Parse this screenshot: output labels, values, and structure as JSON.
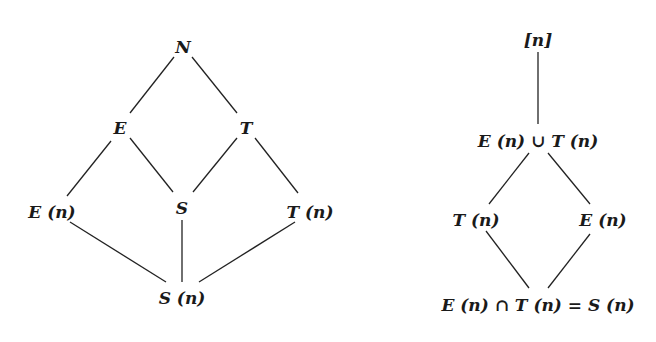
{
  "left_lattice": {
    "nodes": {
      "N": {
        "label": "N",
        "x": 183,
        "y": 47
      },
      "E": {
        "label": "E",
        "x": 120,
        "y": 128
      },
      "T": {
        "label": "T",
        "x": 246,
        "y": 128
      },
      "En": {
        "label": "E (n)",
        "x": 52,
        "y": 212
      },
      "S": {
        "label": "S",
        "x": 182,
        "y": 208
      },
      "Tn": {
        "label": "T (n)",
        "x": 310,
        "y": 212
      },
      "Sn": {
        "label": "S (n)",
        "x": 182,
        "y": 298
      }
    },
    "edges": [
      [
        "N",
        "E"
      ],
      [
        "N",
        "T"
      ],
      [
        "E",
        "En"
      ],
      [
        "E",
        "S"
      ],
      [
        "T",
        "S"
      ],
      [
        "T",
        "Tn"
      ],
      [
        "En",
        "Sn"
      ],
      [
        "S",
        "Sn"
      ],
      [
        "Tn",
        "Sn"
      ]
    ]
  },
  "right_lattice": {
    "nodes": {
      "top": {
        "label": "[n]",
        "x": 538,
        "y": 40
      },
      "union": {
        "label": "E (n) ∪ T (n)",
        "x": 538,
        "y": 141
      },
      "Tn": {
        "label": "T (n)",
        "x": 476,
        "y": 220
      },
      "En": {
        "label": "E (n)",
        "x": 603,
        "y": 220
      },
      "inter": {
        "label": "E (n) ∩ T (n) = S (n)",
        "x": 538,
        "y": 305
      }
    },
    "edges": [
      [
        "top",
        "union"
      ],
      [
        "union",
        "Tn"
      ],
      [
        "union",
        "En"
      ],
      [
        "Tn",
        "inter"
      ],
      [
        "En",
        "inter"
      ]
    ]
  },
  "colors": {
    "line": "#222222",
    "text": "#1a1a1a",
    "background": "#ffffff"
  }
}
